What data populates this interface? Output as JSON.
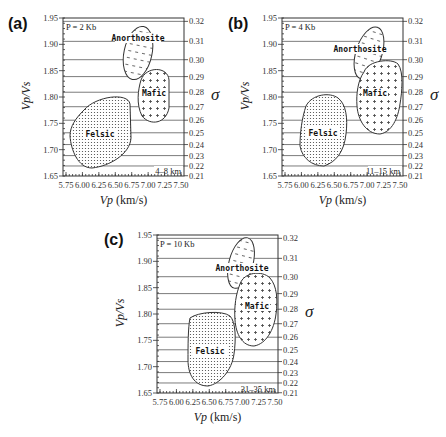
{
  "figure": {
    "x_ticks": [
      "5.75",
      "6.00",
      "6.25",
      "6.50",
      "6.75",
      "7.00",
      "7.25",
      "7.50"
    ],
    "y_ticks_left": [
      "1.95",
      "1.90",
      "1.85",
      "1.80",
      "1.75",
      "1.70",
      "1.65"
    ],
    "y_ticks_right": [
      "0.32",
      "0.31",
      "0.30",
      "0.29",
      "0.28",
      "0.27",
      "0.26",
      "0.25",
      "0.24",
      "0.23",
      "0.22",
      "0.21"
    ],
    "xlabel": "Vp (km/s)",
    "ylabel": "Vp/Vs",
    "ylabel_right": "σ",
    "region_labels": {
      "anorthosite": "Anorthosite",
      "mafic": "Mafic",
      "felsic": "Felsic"
    }
  },
  "panels": [
    {
      "label": "(a)",
      "pressure": "P = 2 Kb",
      "depth": "4–8 km"
    },
    {
      "label": "(b)",
      "pressure": "P = 4 Kb",
      "depth": "11–15 km"
    },
    {
      "label": "(c)",
      "pressure": "P = 10 Kb",
      "depth": "31–35 km"
    }
  ],
  "chart_data": [
    {
      "type": "scatter",
      "title": "(a) P = 2 Kb, 4–8 km",
      "xlabel": "Vp (km/s)",
      "ylabel": "Vp/Vs",
      "ylabel_right": "σ (Poisson's ratio)",
      "xlim": [
        5.75,
        7.5
      ],
      "ylim": [
        1.65,
        1.95
      ],
      "y2lim": [
        0.21,
        0.32
      ],
      "x_ticks": [
        5.75,
        6.0,
        6.25,
        6.5,
        6.75,
        7.0,
        7.25,
        7.5
      ],
      "y_ticks": [
        1.65,
        1.7,
        1.75,
        1.8,
        1.85,
        1.9,
        1.95
      ],
      "y2_ticks": [
        0.21,
        0.22,
        0.23,
        0.24,
        0.25,
        0.26,
        0.27,
        0.28,
        0.29,
        0.3,
        0.31,
        0.32
      ],
      "grid": "horizontal lines at sigma ticks",
      "regions": [
        {
          "name": "Anorthosite",
          "pattern": "dashes",
          "vp_range": [
            6.65,
            7.05
          ],
          "vpvs_range": [
            1.84,
            1.93
          ]
        },
        {
          "name": "Mafic",
          "pattern": "plus",
          "vp_range": [
            6.85,
            7.25
          ],
          "vpvs_range": [
            1.76,
            1.85
          ]
        },
        {
          "name": "Felsic",
          "pattern": "dots",
          "vp_range": [
            5.85,
            6.65
          ],
          "vpvs_range": [
            1.67,
            1.8
          ]
        }
      ]
    },
    {
      "type": "scatter",
      "title": "(b) P = 4 Kb, 11–15 km",
      "xlabel": "Vp (km/s)",
      "ylabel": "Vp/Vs",
      "ylabel_right": "σ (Poisson's ratio)",
      "xlim": [
        5.75,
        7.5
      ],
      "ylim": [
        1.65,
        1.95
      ],
      "y2lim": [
        0.21,
        0.32
      ],
      "x_ticks": [
        5.75,
        6.0,
        6.25,
        6.5,
        6.75,
        7.0,
        7.25,
        7.5
      ],
      "y_ticks": [
        1.65,
        1.7,
        1.75,
        1.8,
        1.85,
        1.9,
        1.95
      ],
      "y2_ticks": [
        0.21,
        0.22,
        0.23,
        0.24,
        0.25,
        0.26,
        0.27,
        0.28,
        0.29,
        0.3,
        0.31,
        0.32
      ],
      "grid": "horizontal lines at sigma ticks",
      "regions": [
        {
          "name": "Anorthosite",
          "pattern": "dashes",
          "vp_range": [
            6.75,
            7.1
          ],
          "vpvs_range": [
            1.84,
            1.93
          ]
        },
        {
          "name": "Mafic",
          "pattern": "plus",
          "vp_range": [
            6.85,
            7.45
          ],
          "vpvs_range": [
            1.74,
            1.87
          ]
        },
        {
          "name": "Felsic",
          "pattern": "dots",
          "vp_range": [
            6.0,
            6.65
          ],
          "vpvs_range": [
            1.67,
            1.8
          ]
        }
      ]
    },
    {
      "type": "scatter",
      "title": "(c) P = 10 Kb, 31–35 km",
      "xlabel": "Vp (km/s)",
      "ylabel": "Vp/Vs",
      "ylabel_right": "σ (Poisson's ratio)",
      "xlim": [
        5.75,
        7.5
      ],
      "ylim": [
        1.65,
        1.95
      ],
      "y2lim": [
        0.21,
        0.32
      ],
      "x_ticks": [
        5.75,
        6.0,
        6.25,
        6.5,
        6.75,
        7.0,
        7.25,
        7.5
      ],
      "y_ticks": [
        1.65,
        1.7,
        1.75,
        1.8,
        1.85,
        1.9,
        1.95
      ],
      "y2_ticks": [
        0.21,
        0.22,
        0.23,
        0.24,
        0.25,
        0.26,
        0.27,
        0.28,
        0.29,
        0.3,
        0.31,
        0.32
      ],
      "grid": "horizontal lines at sigma ticks",
      "regions": [
        {
          "name": "Anorthosite",
          "pattern": "dashes",
          "vp_range": [
            6.9,
            7.2
          ],
          "vpvs_range": [
            1.85,
            1.94
          ]
        },
        {
          "name": "Mafic",
          "pattern": "plus",
          "vp_range": [
            6.95,
            7.5
          ],
          "vpvs_range": [
            1.75,
            1.88
          ]
        },
        {
          "name": "Felsic",
          "pattern": "dots",
          "vp_range": [
            6.15,
            6.8
          ],
          "vpvs_range": [
            1.67,
            1.8
          ]
        }
      ]
    }
  ]
}
